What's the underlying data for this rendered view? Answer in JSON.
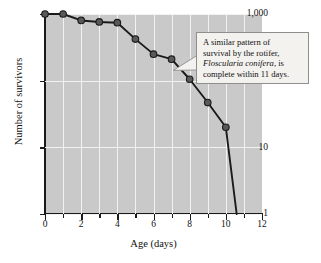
{
  "chart_data": {
    "type": "line",
    "title": "",
    "xlabel": "Age (days)",
    "ylabel": "Number of survivors",
    "xlim": [
      0,
      12
    ],
    "ylim": [
      1,
      1000
    ],
    "yscale": "log",
    "grid": true,
    "legend": null,
    "x_ticks": [
      0,
      2,
      4,
      6,
      8,
      10,
      12
    ],
    "x_tick_labels": [
      "0",
      "2",
      "4",
      "6",
      "8",
      "10",
      "12"
    ],
    "x_minor_ticks": [
      1,
      3,
      5,
      7,
      9,
      11
    ],
    "y_ticks": [
      1,
      10,
      100,
      1000
    ],
    "y_tick_labels": [
      "1",
      "10",
      "100",
      "1,000"
    ],
    "series": [
      {
        "name": "survivors",
        "marker": "circle",
        "x": [
          0,
          1,
          2,
          3,
          4,
          5,
          6,
          7,
          8,
          9,
          10,
          10.6
        ],
        "values": [
          1000,
          1000,
          800,
          760,
          740,
          420,
          250,
          210,
          105,
          47,
          20,
          1
        ]
      }
    ]
  },
  "callout": {
    "line1": "A similar pattern of",
    "line2": "survival by the rotifer,",
    "species": "Floscularia conifera",
    "line3_tail": ", is",
    "line4": "complete within 11 days."
  },
  "colors": {
    "plot_background": "#c9c9c9",
    "gridline": "#f2f2f2",
    "axis": "#1a1a1a",
    "line": "#1a1a1a",
    "marker_fill": "#595959",
    "marker_edge": "#1a1a1a",
    "callout_background": "#f4f2ef",
    "callout_border": "#8e8e8e",
    "page_background": "#ffffff"
  }
}
